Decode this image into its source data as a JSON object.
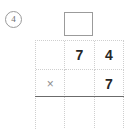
{
  "problem": {
    "number_label": "4",
    "operation": "multiplication"
  },
  "answer_box": {
    "value": "",
    "placeholder": ""
  },
  "grid": {
    "columns": 3,
    "rows": [
      {
        "name": "multiplicand-row",
        "cells": [
          {
            "name": "blank",
            "text": ""
          },
          {
            "name": "tens-digit",
            "text": "7"
          },
          {
            "name": "ones-digit",
            "text": "4"
          }
        ]
      },
      {
        "name": "multiplier-row",
        "cells": [
          {
            "name": "operator",
            "text": "×"
          },
          {
            "name": "blank",
            "text": ""
          },
          {
            "name": "ones-digit",
            "text": "7"
          }
        ]
      },
      {
        "name": "product-row",
        "cells": [
          {
            "name": "blank",
            "text": ""
          },
          {
            "name": "blank",
            "text": ""
          },
          {
            "name": "blank",
            "text": ""
          }
        ]
      }
    ]
  },
  "colors": {
    "digit": "#272727",
    "operator": "#8d8d8d",
    "gridline": "#cfcfcf",
    "rule": "#6b6b6b",
    "box_border": "#9b9b9b",
    "marker": "#6f6f6f",
    "background": "#ffffff"
  }
}
